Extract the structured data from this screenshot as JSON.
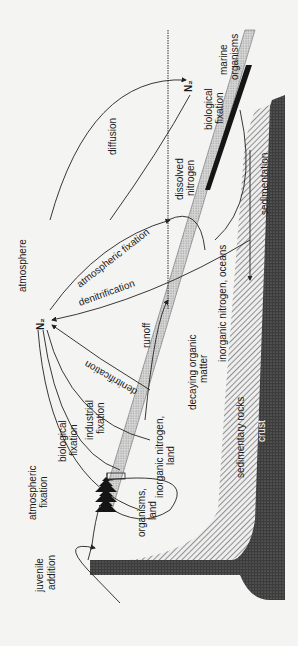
{
  "diagram": {
    "orientation": "rotated 90° counter-clockwise",
    "colors": {
      "background": "#f4f4f2",
      "line": "#222222",
      "crust": "#4a4a4a",
      "organic_band": "#bdbdbd",
      "marine_organisms": "#151515"
    },
    "labels": {
      "atmosphere": "atmosphere",
      "n2_main": "N₂",
      "n2_ocean": "N₂",
      "diffusion": "diffusion",
      "atmospheric_fixation_ocean": "atmospheric fixation",
      "denitrification_ocean": "denitrification",
      "denitrification_land": "denitrification",
      "runoff": "runoff",
      "dissolved_nitrogen_1": "dissolved",
      "dissolved_nitrogen_2": "nitrogen",
      "biological_fixation_marine_1": "biological",
      "biological_fixation_marine_2": "fixation",
      "marine_organisms_1": "marine",
      "marine_organisms_2": "organisms",
      "sedimentation": "sedimentation",
      "inorganic_nitrogen_oceans": "inorganic nitrogen, oceans",
      "decaying_organic_matter_1": "decaying organic",
      "decaying_organic_matter_2": "matter",
      "sedimentary_rocks": "sedimentary rocks",
      "crust": "crust",
      "industrial_fixation_1": "industrial",
      "industrial_fixation_2": "fixation",
      "inorganic_nitrogen_land_1": "inorganic nitrogen,",
      "inorganic_nitrogen_land_2": "land",
      "biological_fixation_land_1": "biological",
      "biological_fixation_land_2": "fixation",
      "organisms_land_1": "organisms,",
      "organisms_land_2": "land",
      "atmospheric_fixation_land_1": "atmospheric",
      "atmospheric_fixation_land_2": "fixation",
      "juvenile_addition_1": "juvenile",
      "juvenile_addition_2": "addition"
    }
  }
}
